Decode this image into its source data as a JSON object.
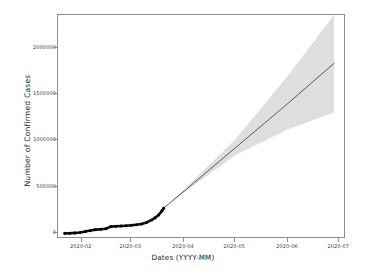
{
  "chart_data": {
    "type": "line",
    "title": "",
    "xlabel": "Dates (YYYY-MM)",
    "ylabel": "Number of Confirmed Cases",
    "grid": false,
    "legend": "none",
    "xlim": [
      "2020-01-18",
      "2020-07-05"
    ],
    "ylim": [
      -60000,
      2350000
    ],
    "ytick_labels": [
      "0",
      "500000",
      "1000000",
      "1500000",
      "2000000"
    ],
    "ytick_values": [
      0,
      500000,
      1000000,
      1500000,
      2000000
    ],
    "xtick_labels": [
      "2020-02",
      "2020-03",
      "2020-04",
      "2020-05",
      "2020-06",
      "2020-07"
    ],
    "xtick_values": [
      "2020-02-01",
      "2020-03-01",
      "2020-04-01",
      "2020-05-01",
      "2020-06-01",
      "2020-07-01"
    ],
    "series": [
      {
        "name": "Observed confirmed cases",
        "style": "thick-black-markers",
        "color": "#111111",
        "x": [
          "2020-01-22",
          "2020-01-25",
          "2020-01-28",
          "2020-01-31",
          "2020-02-03",
          "2020-02-06",
          "2020-02-09",
          "2020-02-12",
          "2020-02-15",
          "2020-02-18",
          "2020-02-21",
          "2020-02-24",
          "2020-02-27",
          "2020-03-01",
          "2020-03-04",
          "2020-03-07",
          "2020-03-10",
          "2020-03-13",
          "2020-03-15",
          "2020-03-17",
          "2020-03-19",
          "2020-03-20"
        ],
        "values": [
          560,
          2118,
          5578,
          9927,
          19881,
          31211,
          40554,
          45221,
          50983,
          73336,
          76769,
          79561,
          82763,
          87137,
          93091,
          102050,
          118326,
          145193,
          167466,
          197168,
          242708,
          272167
        ]
      },
      {
        "name": "Forecast (mean)",
        "style": "thin-line",
        "color": "#4a4a4a",
        "x": [
          "2020-03-20",
          "2020-04-01",
          "2020-05-01",
          "2020-06-01",
          "2020-06-28"
        ],
        "values": [
          272167,
          455000,
          920000,
          1400000,
          1830000
        ]
      }
    ],
    "confidence_band": {
      "name": "Prediction interval",
      "color": "#d8d8d8",
      "x": [
        "2020-03-20",
        "2020-04-01",
        "2020-05-01",
        "2020-06-01",
        "2020-06-28"
      ],
      "lower": [
        272167,
        440000,
        840000,
        1120000,
        1300000
      ],
      "upper": [
        272167,
        472000,
        1010000,
        1700000,
        2350000
      ]
    }
  },
  "axes": {
    "frame_color": "#8d8d8d"
  }
}
